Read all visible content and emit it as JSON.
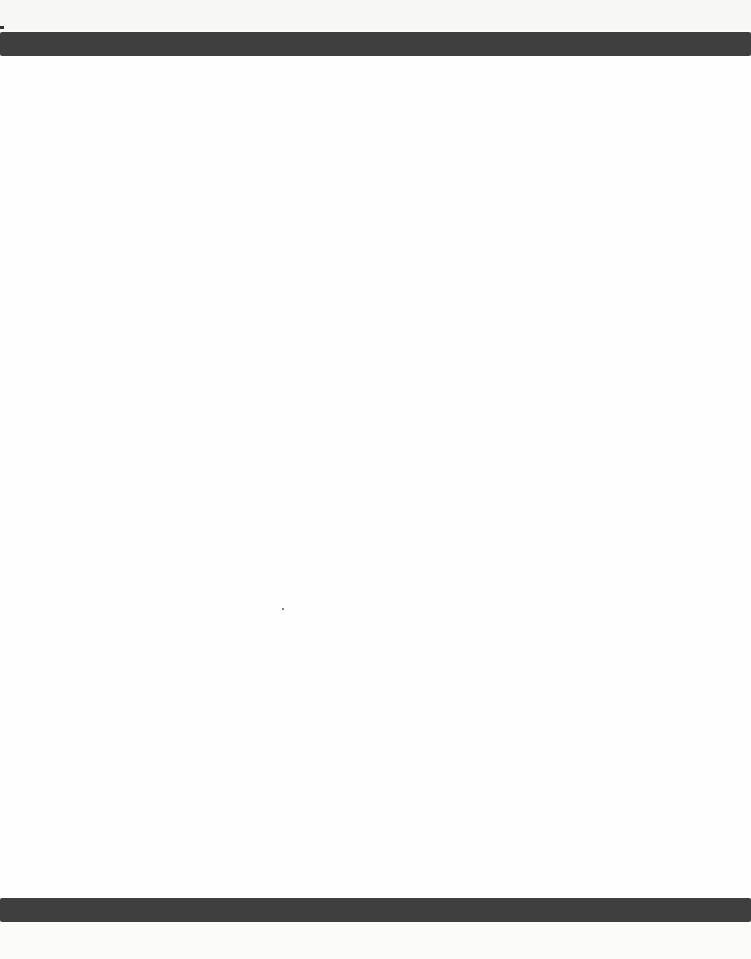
{
  "page": {
    "type": "blank-scanned-page",
    "background_color": "#fbfbfa",
    "bars": [
      {
        "position": "top",
        "color": "#3f3f3f"
      },
      {
        "position": "bottom",
        "color": "#3f3f3f"
      }
    ],
    "text": ""
  }
}
